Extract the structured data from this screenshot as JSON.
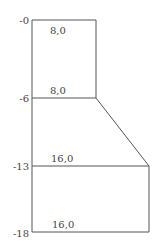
{
  "diagram": {
    "type": "cross-section",
    "depth_labels": [
      "-0",
      "-6",
      "-13",
      "-18"
    ],
    "width_labels": [
      {
        "depth": "-0",
        "value": "8,0"
      },
      {
        "depth": "-6",
        "value": "8,0"
      },
      {
        "depth": "-13",
        "value": "16,0"
      },
      {
        "depth": "-18",
        "value": "16,0"
      }
    ],
    "colors": {
      "line": "#555555",
      "text": "#444444",
      "background": "#ffffff"
    }
  }
}
